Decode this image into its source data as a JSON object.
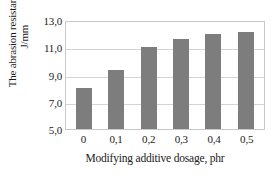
{
  "chart_data": {
    "type": "bar",
    "title": "",
    "categories": [
      "0",
      "0,1",
      "0,2",
      "0,3",
      "0,4",
      "0,5"
    ],
    "values": [
      8.0,
      9.3,
      11.0,
      11.6,
      12.0,
      12.1
    ],
    "xlabel": "Modifying additive dosage, phr",
    "ylabel": "The abrasion resistance, J/mm",
    "ylabel_superscript": "3",
    "ylim": [
      5.0,
      13.0
    ],
    "yticks": [
      "5,0",
      "7,0",
      "9,0",
      "11,0",
      "13,0"
    ],
    "ytick_values": [
      5.0,
      7.0,
      9.0,
      11.0,
      13.0
    ],
    "grid": true,
    "legend": "none",
    "bar_color": "#7d7d7d",
    "gridline_color": "#d4d4d4",
    "plot_border_color": "#c9c9c9",
    "background_color": "#ffffff"
  }
}
